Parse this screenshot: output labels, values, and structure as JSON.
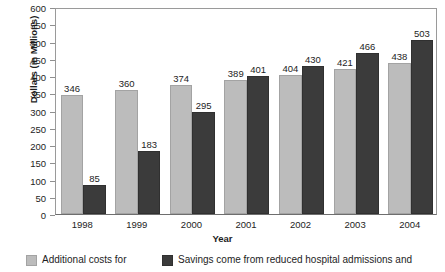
{
  "chart_data": {
    "type": "bar",
    "title": "",
    "xlabel": "Year",
    "ylabel": "Dollars (in Millions)",
    "categories": [
      "1998",
      "1999",
      "2000",
      "2001",
      "2002",
      "2003",
      "2004"
    ],
    "series": [
      {
        "name": "Additional costs for",
        "color": "#bcbcbc",
        "values": [
          346,
          360,
          374,
          389,
          404,
          421,
          438
        ]
      },
      {
        "name": "Savings come from reduced hospital admissions and",
        "color": "#3b3b3b",
        "values": [
          85,
          183,
          295,
          401,
          430,
          466,
          503
        ]
      }
    ],
    "ylim": [
      0,
      600
    ],
    "ytick_step": 50,
    "yticks": [
      0,
      50,
      100,
      150,
      200,
      250,
      300,
      350,
      400,
      450,
      500,
      550,
      600
    ],
    "ytick_labels": [
      "0",
      "50",
      "100",
      "150",
      "200",
      "250",
      "300",
      "350",
      "400",
      "450",
      "500",
      "550",
      "600"
    ],
    "grid": false,
    "legend_position": "bottom",
    "data_labels": true
  }
}
